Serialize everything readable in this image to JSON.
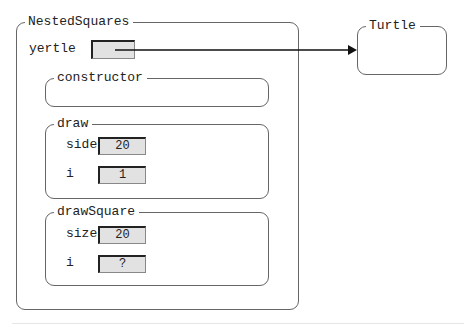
{
  "outer_object": {
    "title": "NestedSquares",
    "fields": [
      {
        "name": "yertle",
        "value": ""
      }
    ]
  },
  "referenced_object": {
    "title": "Turtle"
  },
  "frames": [
    {
      "title": "constructor",
      "variables": []
    },
    {
      "title": "draw",
      "variables": [
        {
          "name": "side",
          "value": "20"
        },
        {
          "name": "i",
          "value": "1"
        }
      ]
    },
    {
      "title": "drawSquare",
      "variables": [
        {
          "name": "size",
          "value": "20"
        },
        {
          "name": "i",
          "value": "?"
        }
      ]
    }
  ],
  "colors": {
    "border": "#666666",
    "value_box_fill": "#e2e2e2",
    "arrow": "#111111"
  }
}
